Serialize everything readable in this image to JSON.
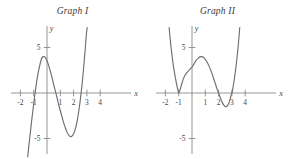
{
  "figure": {
    "background_color": "#ffffff",
    "curve_color": "#6e6e6e",
    "axis_color": "#8a8a8a",
    "label_color": "#3f3f3f"
  },
  "panels": [
    {
      "title": "Graph I",
      "x_axis_label": "x",
      "y_axis_label": "y",
      "x_ticks": [
        "-2",
        "-1",
        "1",
        "2",
        "3",
        "4"
      ],
      "y_ticks": [
        "5",
        "-5"
      ]
    },
    {
      "title": "Graph II",
      "x_axis_label": "x",
      "y_axis_label": "y",
      "x_ticks": [
        "-2",
        "-1",
        "1",
        "2",
        "3",
        "4"
      ],
      "y_ticks": [
        "5",
        "-5"
      ]
    }
  ],
  "chart_data": [
    {
      "type": "line",
      "title": "Graph I",
      "xlabel": "x",
      "ylabel": "y",
      "xlim": [
        -2.3,
        4.4
      ],
      "ylim": [
        -7.0,
        7.2
      ],
      "grid": false,
      "legend": "none",
      "description": "Cubic polynomial with three real roots; rises steeply on the right, falls steeply on the left.",
      "x_tick_values": [
        -2,
        -1,
        1,
        2,
        3,
        4
      ],
      "y_tick_values": [
        5,
        -5
      ],
      "roots": [
        -1.0,
        0.75,
        2.5
      ],
      "local_maximum": {
        "x": -0.3,
        "y": 4.0
      },
      "local_minimum": {
        "x": 1.8,
        "y": -4.8
      },
      "y_intercept": 3.5,
      "end_behavior": {
        "left": "down",
        "right": "up"
      },
      "series": [
        {
          "name": "Graph I curve",
          "points": [
            [
              -1.45,
              -7.0
            ],
            [
              -1.35,
              -5.6
            ],
            [
              -1.25,
              -4.3
            ],
            [
              -1.15,
              -3.0
            ],
            [
              -1.05,
              -1.8
            ],
            [
              -0.95,
              -0.6
            ],
            [
              -0.85,
              0.5
            ],
            [
              -0.75,
              1.5
            ],
            [
              -0.65,
              2.3
            ],
            [
              -0.55,
              3.0
            ],
            [
              -0.45,
              3.6
            ],
            [
              -0.35,
              3.95
            ],
            [
              -0.25,
              4.0
            ],
            [
              -0.15,
              3.95
            ],
            [
              -0.05,
              3.7
            ],
            [
              0.05,
              3.35
            ],
            [
              0.15,
              2.9
            ],
            [
              0.25,
              2.4
            ],
            [
              0.35,
              1.85
            ],
            [
              0.45,
              1.25
            ],
            [
              0.55,
              0.65
            ],
            [
              0.65,
              0.1
            ],
            [
              0.75,
              -0.5
            ],
            [
              0.9,
              -1.4
            ],
            [
              1.05,
              -2.2
            ],
            [
              1.2,
              -3.0
            ],
            [
              1.35,
              -3.7
            ],
            [
              1.5,
              -4.3
            ],
            [
              1.65,
              -4.65
            ],
            [
              1.8,
              -4.8
            ],
            [
              1.95,
              -4.6
            ],
            [
              2.1,
              -4.1
            ],
            [
              2.25,
              -3.2
            ],
            [
              2.4,
              -1.9
            ],
            [
              2.55,
              -0.2
            ],
            [
              2.7,
              1.9
            ],
            [
              2.85,
              4.4
            ],
            [
              2.95,
              6.3
            ],
            [
              3.02,
              7.2
            ]
          ]
        }
      ]
    },
    {
      "type": "line",
      "title": "Graph II",
      "xlabel": "x",
      "ylabel": "y",
      "xlim": [
        -2.3,
        4.4
      ],
      "ylim": [
        -7.0,
        7.2
      ],
      "grid": false,
      "legend": "none",
      "description": "Quartic polynomial tangent to the x-axis at x = -1 (double root) with simple roots at x = 2 and x = 3; opens upward at both ends.",
      "x_tick_values": [
        -2,
        -1,
        1,
        2,
        3,
        4
      ],
      "y_tick_values": [
        5,
        -5
      ],
      "roots": [
        -1.0,
        -1.0,
        2.0,
        3.0
      ],
      "local_maximum": {
        "x": 0.7,
        "y": 4.0
      },
      "local_minima": [
        {
          "x": -1.0,
          "y": 0.0
        },
        {
          "x": 2.55,
          "y": -1.5
        }
      ],
      "y_intercept": 2.2,
      "end_behavior": {
        "left": "up",
        "right": "up"
      },
      "series": [
        {
          "name": "Graph II curve",
          "points": [
            [
              -1.72,
              7.2
            ],
            [
              -1.65,
              6.1
            ],
            [
              -1.58,
              5.1
            ],
            [
              -1.5,
              4.1
            ],
            [
              -1.42,
              3.2
            ],
            [
              -1.34,
              2.45
            ],
            [
              -1.26,
              1.75
            ],
            [
              -1.2,
              1.3
            ],
            [
              -1.14,
              0.85
            ],
            [
              -1.08,
              0.45
            ],
            [
              -1.0,
              0.0
            ],
            [
              -0.92,
              0.28
            ],
            [
              -0.85,
              0.6
            ],
            [
              -0.75,
              1.1
            ],
            [
              -0.65,
              1.55
            ],
            [
              -0.5,
              2.0
            ],
            [
              -0.35,
              2.3
            ],
            [
              -0.2,
              2.55
            ],
            [
              0.0,
              2.85
            ],
            [
              0.15,
              3.2
            ],
            [
              0.3,
              3.55
            ],
            [
              0.45,
              3.8
            ],
            [
              0.6,
              3.97
            ],
            [
              0.72,
              4.0
            ],
            [
              0.85,
              3.92
            ],
            [
              1.0,
              3.7
            ],
            [
              1.15,
              3.35
            ],
            [
              1.3,
              2.9
            ],
            [
              1.45,
              2.35
            ],
            [
              1.6,
              1.7
            ],
            [
              1.75,
              1.05
            ],
            [
              1.88,
              0.45
            ],
            [
              2.0,
              0.0
            ],
            [
              2.12,
              -0.5
            ],
            [
              2.25,
              -0.95
            ],
            [
              2.38,
              -1.3
            ],
            [
              2.5,
              -1.48
            ],
            [
              2.62,
              -1.45
            ],
            [
              2.74,
              -1.2
            ],
            [
              2.86,
              -0.72
            ],
            [
              2.96,
              -0.15
            ],
            [
              3.0,
              0.0
            ],
            [
              3.1,
              0.75
            ],
            [
              3.2,
              1.7
            ],
            [
              3.3,
              2.8
            ],
            [
              3.4,
              4.1
            ],
            [
              3.5,
              5.6
            ],
            [
              3.58,
              7.0
            ],
            [
              3.6,
              7.2
            ]
          ]
        }
      ]
    }
  ]
}
